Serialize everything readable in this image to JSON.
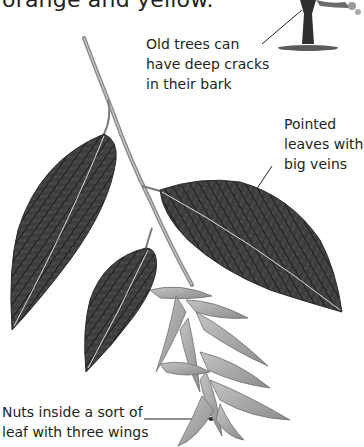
{
  "page": {
    "intro_text": "orange and yellow.",
    "illustration": "hornbeam-branch-with-leaves-and-winged-nuts",
    "tree_thumbnail": "tree-trunk-thumbnail"
  },
  "labels": {
    "bark": {
      "lines": [
        "Old trees can",
        "have deep cracks",
        "in their bark"
      ]
    },
    "leaves": {
      "lines": [
        "Pointed",
        "leaves with",
        "big veins"
      ]
    },
    "nuts": {
      "lines": [
        "Nuts inside a sort of",
        "leaf with three wings"
      ]
    }
  },
  "colors": {
    "text": "#231f20",
    "leaf_dark": "#3a3a3a",
    "leaf_mid": "#6b6b6b",
    "nut_wing": "#a8a8a8",
    "twig": "#8a8a8a",
    "background": "#ffffff"
  }
}
